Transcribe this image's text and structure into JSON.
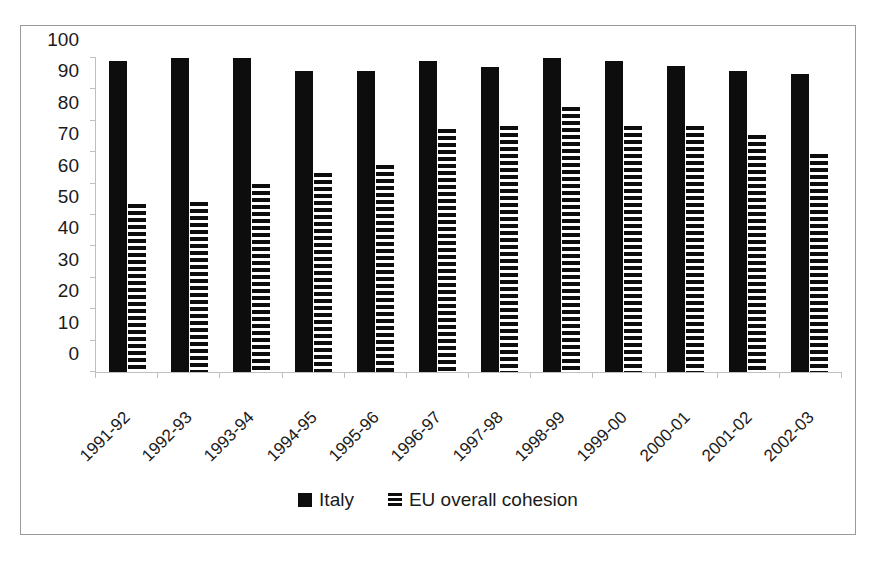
{
  "chart_data": {
    "type": "bar",
    "title": "",
    "subtitle": "",
    "xlabel": "",
    "ylabel": "",
    "ylim": [
      0,
      100
    ],
    "yticks": [
      0,
      10,
      20,
      30,
      40,
      50,
      60,
      70,
      80,
      90,
      100
    ],
    "grid": false,
    "legend_position": "bottom",
    "categories": [
      "1991-92",
      "1992-93",
      "1993-94",
      "1994-95",
      "1995-96",
      "1996-97",
      "1997-98",
      "1998-99",
      "1999-00",
      "2000-01",
      "2001-02",
      "2002-03"
    ],
    "series": [
      {
        "name": "Italy",
        "fill": "solid-black",
        "color": "#0d0d0d",
        "values": [
          99,
          100,
          100,
          96,
          96,
          99,
          97,
          100,
          99,
          97.5,
          96,
          95
        ]
      },
      {
        "name": "EU overall cohesion",
        "fill": "horizontal-hatch",
        "color": "#0d0d0d",
        "values": [
          53.5,
          54,
          60,
          63.5,
          66,
          77.5,
          78.5,
          84.5,
          78.5,
          78.5,
          75.5,
          69.5
        ]
      }
    ]
  },
  "legend": {
    "items": [
      {
        "label": "Italy",
        "swatch": "solid-square-icon"
      },
      {
        "label": "EU overall cohesion",
        "swatch": "hatched-square-icon"
      }
    ]
  }
}
